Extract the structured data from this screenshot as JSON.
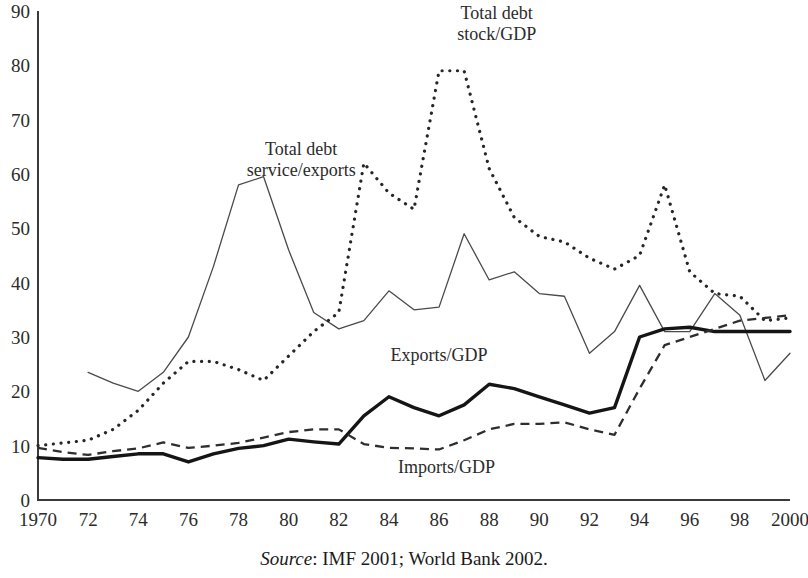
{
  "chart_data": {
    "type": "line",
    "title": "",
    "subtitle": "",
    "xlabel": "",
    "ylabel": "",
    "xlim": [
      1970,
      2000
    ],
    "ylim": [
      0,
      90
    ],
    "grid": false,
    "legend_position": "inline-annotations",
    "y_ticks": [
      0,
      10,
      20,
      30,
      40,
      50,
      60,
      70,
      80,
      90
    ],
    "y_tick_labels": [
      "0",
      "10",
      "20",
      "30",
      "40",
      "50",
      "60",
      "70",
      "80",
      "90"
    ],
    "x_ticks": [
      1970,
      1972,
      1974,
      1976,
      1978,
      1980,
      1982,
      1984,
      1986,
      1988,
      1990,
      1992,
      1994,
      1996,
      1998,
      2000
    ],
    "x_tick_labels": [
      "1970",
      "72",
      "74",
      "76",
      "78",
      "80",
      "82",
      "84",
      "86",
      "88",
      "90",
      "92",
      "94",
      "96",
      "98",
      "2000"
    ],
    "x": [
      1970,
      1971,
      1972,
      1973,
      1974,
      1975,
      1976,
      1977,
      1978,
      1979,
      1980,
      1981,
      1982,
      1983,
      1984,
      1985,
      1986,
      1987,
      1988,
      1989,
      1990,
      1991,
      1992,
      1993,
      1994,
      1995,
      1996,
      1997,
      1998,
      1999,
      2000
    ],
    "series": [
      {
        "name": "Total debt service/exports",
        "style": "solid-thin",
        "label_text_line1": "Total debt",
        "label_text_line2": "service/exports",
        "x": [
          1972,
          1973,
          1974,
          1975,
          1976,
          1977,
          1978,
          1979,
          1980,
          1981,
          1982,
          1983,
          1984,
          1985,
          1986,
          1987,
          1988,
          1989,
          1990,
          1991,
          1992,
          1993,
          1994,
          1995,
          1996,
          1997,
          1998,
          1999,
          2000
        ],
        "values": [
          23.5,
          21.5,
          20.0,
          23.5,
          30.0,
          43.0,
          58.0,
          59.5,
          46.0,
          34.5,
          31.5,
          33.0,
          38.5,
          35.0,
          35.5,
          49.0,
          40.5,
          42.0,
          38.0,
          37.5,
          27.0,
          31.0,
          39.5,
          31.0,
          31.0,
          38.0,
          34.0,
          22.0,
          27.0
        ]
      },
      {
        "name": "Total debt stock/GDP",
        "style": "dotted",
        "label_text_line1": "Total debt",
        "label_text_line2": "stock/GDP",
        "x": [
          1970,
          1971,
          1972,
          1973,
          1974,
          1975,
          1976,
          1977,
          1978,
          1979,
          1980,
          1981,
          1982,
          1983,
          1984,
          1985,
          1986,
          1987,
          1988,
          1989,
          1990,
          1991,
          1992,
          1993,
          1994,
          1995,
          1996,
          1997,
          1998,
          1999,
          2000
        ],
        "values": [
          10.0,
          10.5,
          11.0,
          13.0,
          16.5,
          21.5,
          25.5,
          25.5,
          24.0,
          22.0,
          26.5,
          31.0,
          34.5,
          62.0,
          56.5,
          53.5,
          79.0,
          79.0,
          61.0,
          52.0,
          48.5,
          47.5,
          44.5,
          42.5,
          45.0,
          58.0,
          42.0,
          38.0,
          37.5,
          33.0,
          33.5
        ]
      },
      {
        "name": "Exports/GDP",
        "style": "bold-solid",
        "label_text_line1": "Exports/GDP",
        "label_text_line2": "",
        "x": [
          1970,
          1971,
          1972,
          1973,
          1974,
          1975,
          1976,
          1977,
          1978,
          1979,
          1980,
          1981,
          1982,
          1983,
          1984,
          1985,
          1986,
          1987,
          1988,
          1989,
          1990,
          1991,
          1992,
          1993,
          1994,
          1995,
          1996,
          1997,
          1998,
          1999,
          2000
        ],
        "values": [
          7.8,
          7.5,
          7.5,
          8.0,
          8.5,
          8.5,
          7.0,
          8.5,
          9.5,
          10.0,
          11.2,
          10.7,
          10.3,
          15.5,
          19.0,
          17.0,
          15.5,
          17.5,
          21.3,
          20.5,
          19.0,
          17.5,
          16.0,
          17.0,
          30.0,
          31.5,
          31.8,
          31.0,
          31.0,
          31.0,
          31.0
        ]
      },
      {
        "name": "Imports/GDP",
        "style": "dashed",
        "label_text_line1": "Imports/GDP",
        "label_text_line2": "",
        "x": [
          1970,
          1971,
          1972,
          1973,
          1974,
          1975,
          1976,
          1977,
          1978,
          1979,
          1980,
          1981,
          1982,
          1983,
          1984,
          1985,
          1986,
          1987,
          1988,
          1989,
          1990,
          1991,
          1992,
          1993,
          1994,
          1995,
          1996,
          1997,
          1998,
          1999,
          2000
        ],
        "values": [
          9.6,
          8.8,
          8.3,
          9.0,
          9.5,
          10.6,
          9.6,
          10.0,
          10.5,
          11.5,
          12.5,
          13.0,
          13.0,
          10.3,
          9.6,
          9.5,
          9.3,
          11.0,
          13.0,
          14.0,
          14.0,
          14.3,
          13.0,
          12.0,
          20.5,
          28.5,
          30.0,
          31.5,
          33.0,
          33.5,
          34.0
        ]
      }
    ],
    "annotations": [
      {
        "id": "label-total-debt-service",
        "text_line1": "Total debt",
        "text_line2": "service/exports",
        "x": 1980.5,
        "y": 63.5
      },
      {
        "id": "label-total-debt-stock",
        "text_line1": "Total debt",
        "text_line2": "stock/GDP",
        "x": 1988.3,
        "y": 88.5
      },
      {
        "id": "label-exports-gdp",
        "text_line1": "Exports/GDP",
        "text_line2": "",
        "x": 1986.0,
        "y": 25.5
      },
      {
        "id": "label-imports-gdp",
        "text_line1": "Imports/GDP",
        "text_line2": "",
        "x": 1986.3,
        "y": 5.0
      }
    ]
  },
  "source": {
    "prefix": "Source",
    "text": ": IMF 2001; World Bank 2002."
  }
}
